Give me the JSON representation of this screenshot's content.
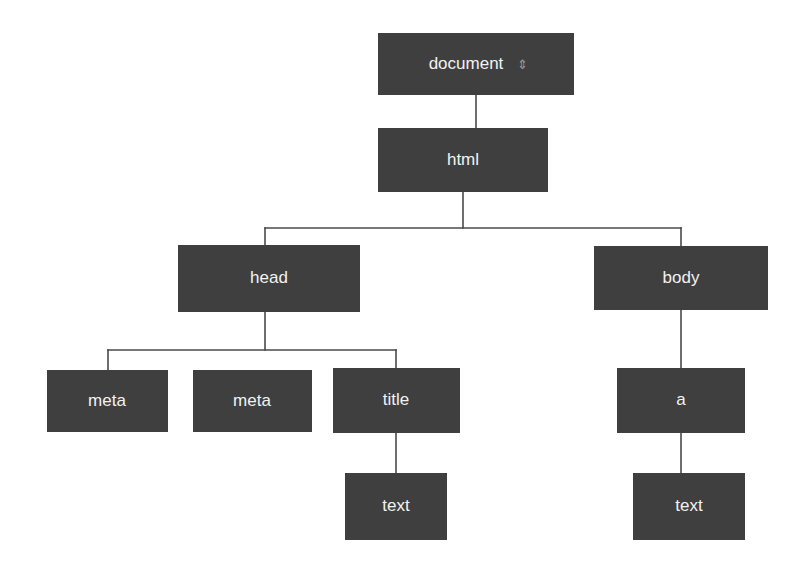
{
  "diagram": {
    "background_color": "#ffffff",
    "node_fill_color": "#3f3f3f",
    "node_text_color": "#f2f2f2",
    "edge_color": "#4a4a4a",
    "nodes": [
      {
        "id": "document",
        "label": "document",
        "x": 378,
        "y": 33,
        "w": 196,
        "h": 62,
        "marker": "⇕"
      },
      {
        "id": "html",
        "label": "html",
        "x": 378,
        "y": 128,
        "w": 170,
        "h": 64
      },
      {
        "id": "head",
        "label": "head",
        "x": 178,
        "y": 245,
        "w": 182,
        "h": 67
      },
      {
        "id": "body",
        "label": "body",
        "x": 594,
        "y": 246,
        "w": 174,
        "h": 64
      },
      {
        "id": "meta1",
        "label": "meta",
        "x": 47,
        "y": 370,
        "w": 121,
        "h": 62
      },
      {
        "id": "meta2",
        "label": "meta",
        "x": 193,
        "y": 370,
        "w": 119,
        "h": 62
      },
      {
        "id": "title",
        "label": "title",
        "x": 333,
        "y": 368,
        "w": 127,
        "h": 65
      },
      {
        "id": "a",
        "label": "a",
        "x": 617,
        "y": 368,
        "w": 128,
        "h": 65
      },
      {
        "id": "text1",
        "label": "text",
        "x": 345,
        "y": 473,
        "w": 102,
        "h": 67
      },
      {
        "id": "text2",
        "label": "text",
        "x": 633,
        "y": 473,
        "w": 112,
        "h": 67
      }
    ],
    "edges": [
      {
        "id": "document-html",
        "from": "document",
        "to": "html",
        "type": "straight"
      },
      {
        "id": "html-head",
        "from": "html",
        "to": "head",
        "type": "elbow"
      },
      {
        "id": "html-body",
        "from": "html",
        "to": "body",
        "type": "elbow"
      },
      {
        "id": "head-meta1",
        "from": "head",
        "to": "meta1",
        "type": "elbow"
      },
      {
        "id": "head-title",
        "from": "head",
        "to": "title",
        "type": "elbow"
      },
      {
        "id": "title-text1",
        "from": "title",
        "to": "text1",
        "type": "straight"
      },
      {
        "id": "body-a",
        "from": "body",
        "to": "a",
        "type": "straight"
      },
      {
        "id": "a-text2",
        "from": "a",
        "to": "text2",
        "type": "straight"
      }
    ]
  }
}
